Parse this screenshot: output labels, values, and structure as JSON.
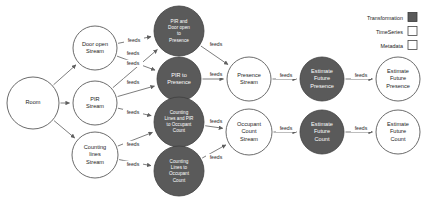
{
  "legend": {
    "title": "",
    "items": [
      {
        "label": "Transformation",
        "swatch_fill": "#5a5a5a",
        "swatch_stroke": "#3a3a3a"
      },
      {
        "label": "TimeSeries",
        "swatch_fill": "#ffffff",
        "swatch_stroke": "#444444"
      },
      {
        "label": "Metadata",
        "swatch_fill": "#ffffff",
        "swatch_stroke": "#444444"
      }
    ]
  },
  "colors": {
    "transformation_fill": "#5a5a5a",
    "transformation_stroke": "#3f3f3f",
    "transformation_text": "#ffffff",
    "timeseries_fill": "#ffffff",
    "timeseries_stroke": "#5a5a5a",
    "timeseries_text": "#1c1c1c",
    "metadata_fill": "#ffffff",
    "metadata_stroke": "#5a5a5a",
    "metadata_text": "#1c1c1c",
    "edge_stroke": "#6e6e6e",
    "background": "#ffffff"
  },
  "nodes": [
    {
      "id": "room",
      "type": "metadata",
      "cx": 33,
      "cy": 103,
      "r": 26,
      "lines": [
        "Room"
      ]
    },
    {
      "id": "door-open-stream",
      "type": "timeseries",
      "cx": 95,
      "cy": 48,
      "r": 22,
      "lines": [
        "Door open",
        "Stream"
      ]
    },
    {
      "id": "pir-stream",
      "type": "timeseries",
      "cx": 95,
      "cy": 103,
      "r": 22,
      "lines": [
        "PIR",
        "Stream"
      ]
    },
    {
      "id": "counting-lines-stream",
      "type": "timeseries",
      "cx": 95,
      "cy": 155,
      "r": 23,
      "lines": [
        "Counting",
        "lines",
        "Stream"
      ]
    },
    {
      "id": "pir-and-door-open-to-presence",
      "type": "transformation",
      "cx": 179,
      "cy": 31,
      "r": 25,
      "lines": [
        "PIR and",
        "Door open",
        "to",
        "Presence"
      ]
    },
    {
      "id": "pir-to-presence",
      "type": "transformation",
      "cx": 179,
      "cy": 79,
      "r": 22,
      "lines": [
        "PIR to",
        "Presence"
      ]
    },
    {
      "id": "counting-lines-and-pir-to-occupant-count",
      "type": "transformation",
      "cx": 179,
      "cy": 122,
      "r": 25,
      "lines": [
        "Counting",
        "Lines and PIR",
        "to Occupant",
        "Count"
      ]
    },
    {
      "id": "counting-lines-to-occupant-count",
      "type": "transformation",
      "cx": 179,
      "cy": 171,
      "r": 25,
      "lines": [
        "Counting",
        "Lines to",
        "Occupant",
        "Count"
      ]
    },
    {
      "id": "presence-stream",
      "type": "timeseries",
      "cx": 249,
      "cy": 79,
      "r": 22,
      "lines": [
        "Presence",
        "Stream"
      ]
    },
    {
      "id": "occupant-count-stream",
      "type": "timeseries",
      "cx": 249,
      "cy": 132,
      "r": 23,
      "lines": [
        "Occupant",
        "Count",
        "Stream"
      ]
    },
    {
      "id": "estimate-future-presence-transform",
      "type": "transformation",
      "cx": 322,
      "cy": 79,
      "r": 22,
      "lines": [
        "Estimate",
        "Future",
        "Presence"
      ]
    },
    {
      "id": "estimate-future-count-transform",
      "type": "transformation",
      "cx": 322,
      "cy": 132,
      "r": 22,
      "lines": [
        "Estimate",
        "Future",
        "Count"
      ]
    },
    {
      "id": "estimate-future-presence-stream",
      "type": "timeseries",
      "cx": 398,
      "cy": 79,
      "r": 22,
      "lines": [
        "Estimate",
        "Future",
        "Presence"
      ]
    },
    {
      "id": "estimate-future-count-stream",
      "type": "timeseries",
      "cx": 398,
      "cy": 132,
      "r": 22,
      "lines": [
        "Estimate",
        "Future",
        "Count"
      ]
    }
  ],
  "edges": [
    {
      "from": "room",
      "to": "door-open-stream",
      "label": ""
    },
    {
      "from": "room",
      "to": "pir-stream",
      "label": ""
    },
    {
      "from": "room",
      "to": "counting-lines-stream",
      "label": ""
    },
    {
      "from": "door-open-stream",
      "to": "pir-and-door-open-to-presence",
      "label": "feeds",
      "lx": 134,
      "ly": 42
    },
    {
      "from": "door-open-stream",
      "to": "pir-to-presence",
      "label": "feeds",
      "lx": 133,
      "ly": 65
    },
    {
      "from": "pir-stream",
      "to": "pir-to-presence",
      "label": "feeds",
      "lx": 133,
      "ly": 84
    },
    {
      "from": "pir-stream",
      "to": "pir-and-door-open-to-presence",
      "label": "feeds",
      "lx": 133,
      "ly": 55
    },
    {
      "from": "pir-stream",
      "to": "counting-lines-and-pir-to-occupant-count",
      "label": "feeds",
      "lx": 133,
      "ly": 114
    },
    {
      "from": "counting-lines-stream",
      "to": "counting-lines-and-pir-to-occupant-count",
      "label": "feeds",
      "lx": 133,
      "ly": 146
    },
    {
      "from": "counting-lines-stream",
      "to": "counting-lines-to-occupant-count",
      "label": "feeds",
      "lx": 133,
      "ly": 166
    },
    {
      "from": "pir-and-door-open-to-presence",
      "to": "presence-stream",
      "label": "feeds",
      "lx": 216,
      "ly": 46
    },
    {
      "from": "pir-to-presence",
      "to": "presence-stream",
      "label": "feeds",
      "lx": 216,
      "ly": 76
    },
    {
      "from": "counting-lines-and-pir-to-occupant-count",
      "to": "occupant-count-stream",
      "label": "feeds",
      "lx": 216,
      "ly": 123
    },
    {
      "from": "counting-lines-to-occupant-count",
      "to": "occupant-count-stream",
      "label": "feeds",
      "lx": 216,
      "ly": 159
    },
    {
      "from": "presence-stream",
      "to": "estimate-future-presence-transform",
      "label": "feeds",
      "lx": 286,
      "ly": 77
    },
    {
      "from": "occupant-count-stream",
      "to": "estimate-future-count-transform",
      "label": "feeds",
      "lx": 286,
      "ly": 130
    },
    {
      "from": "estimate-future-presence-transform",
      "to": "estimate-future-presence-stream",
      "label": "feeds",
      "lx": 361,
      "ly": 77
    },
    {
      "from": "estimate-future-count-transform",
      "to": "estimate-future-count-stream",
      "label": "feeds",
      "lx": 361,
      "ly": 130
    }
  ]
}
